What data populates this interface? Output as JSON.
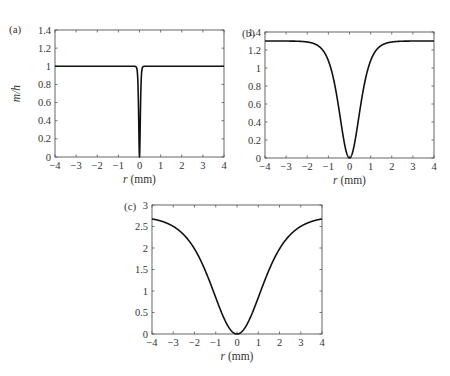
{
  "chart_data": [
    {
      "type": "line",
      "panel_label": "(a)",
      "xlabel_italic": "r",
      "xlabel_unit": " (mm)",
      "ylabel": "m/h",
      "xlim": [
        -4,
        4
      ],
      "ylim": [
        0,
        1.4
      ],
      "xticks": [
        "−4",
        "−3",
        "−2",
        "−1",
        "0",
        "1",
        "2",
        "3",
        "4"
      ],
      "yticks": [
        "0",
        "0.2",
        "0.4",
        "0.6",
        "0.8",
        "1",
        "1.2",
        "1.4"
      ],
      "box": {
        "x0": 55,
        "x1": 224,
        "y0": 30,
        "y1": 157
      },
      "curve": {
        "form": "tanh",
        "amplitude": 1.0,
        "width": 0.05
      },
      "description": "Flat at 1 with a very narrow dip to 0 at r = 0"
    },
    {
      "type": "line",
      "panel_label": "(b)",
      "xlabel_italic": "r",
      "xlabel_unit": " (mm)",
      "ylabel": "",
      "xlim": [
        -4,
        4
      ],
      "ylim": [
        0,
        1.4
      ],
      "xticks": [
        "−4",
        "−3",
        "−2",
        "−1",
        "0",
        "1",
        "2",
        "3",
        "4"
      ],
      "yticks": [
        "0",
        "0.2",
        "0.4",
        "0.6",
        "0.8",
        "1",
        "1.2",
        "1.4"
      ],
      "box": {
        "x0": 265,
        "x1": 434,
        "y0": 32,
        "y1": 158
      },
      "curve": {
        "form": "tanh",
        "amplitude": 1.3,
        "width": 0.65
      },
      "description": "Approaches ~1.3 at |r| = 4, dips to 0 at r = 0"
    },
    {
      "type": "line",
      "panel_label": "(c)",
      "xlabel_italic": "r",
      "xlabel_unit": " (mm)",
      "ylabel": "",
      "xlim": [
        -4,
        4
      ],
      "ylim": [
        0,
        3
      ],
      "xticks": [
        "−4",
        "−3",
        "−2",
        "−1",
        "0",
        "1",
        "2",
        "3",
        "4"
      ],
      "yticks": [
        "0",
        "0.5",
        "1",
        "1.5",
        "2",
        "2.5",
        "3"
      ],
      "box": {
        "x0": 152,
        "x1": 322,
        "y0": 205,
        "y1": 334
      },
      "curve": {
        "form": "tanh",
        "amplitude": 2.75,
        "width": 1.6
      },
      "description": "Wide dip to 0 at r = 0, rising to ~2.5 at |r| = 4"
    }
  ]
}
